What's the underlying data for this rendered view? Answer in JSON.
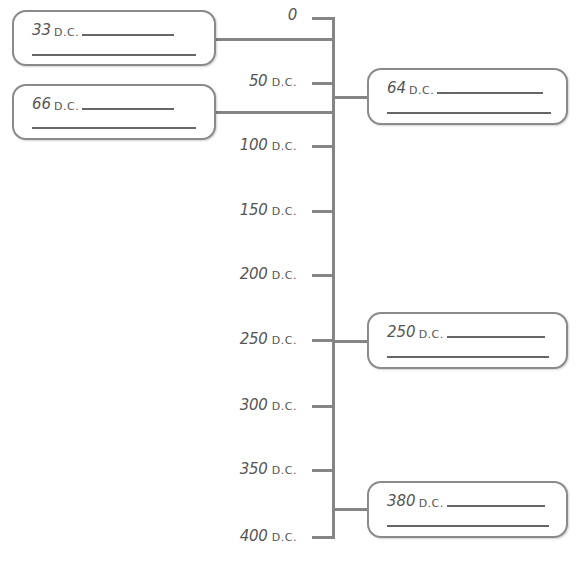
{
  "timeline": {
    "axis_color": "#858585",
    "ticks": [
      {
        "value": "0",
        "era": "",
        "y": 18
      },
      {
        "value": "50",
        "era": "D.C.",
        "y": 83
      },
      {
        "value": "100",
        "era": "D.C.",
        "y": 146
      },
      {
        "value": "150",
        "era": "D.C.",
        "y": 211
      },
      {
        "value": "200",
        "era": "D.C.",
        "y": 275
      },
      {
        "value": "250",
        "era": "D.C.",
        "y": 340
      },
      {
        "value": "300",
        "era": "D.C.",
        "y": 406
      },
      {
        "value": "350",
        "era": "D.C.",
        "y": 470
      },
      {
        "value": "400",
        "era": "D.C.",
        "y": 537
      }
    ],
    "events": [
      {
        "year": "33",
        "era": "D.C.",
        "side": "left",
        "answer_line_1": "",
        "answer_line_2": ""
      },
      {
        "year": "66",
        "era": "D.C.",
        "side": "left",
        "answer_line_1": "",
        "answer_line_2": ""
      },
      {
        "year": "64",
        "era": "D.C.",
        "side": "right",
        "answer_line_1": "",
        "answer_line_2": ""
      },
      {
        "year": "250",
        "era": "D.C.",
        "side": "right",
        "answer_line_1": "",
        "answer_line_2": ""
      },
      {
        "year": "380",
        "era": "D.C.",
        "side": "right",
        "answer_line_1": "",
        "answer_line_2": ""
      }
    ]
  }
}
